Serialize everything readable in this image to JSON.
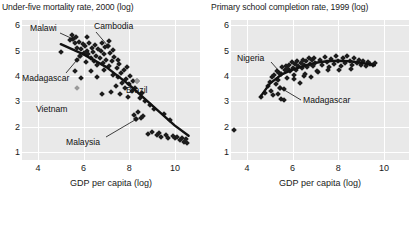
{
  "charts": [
    {
      "id": "under-five-mortality",
      "title": "Under-five mortality rate, 2000 (log)",
      "xlabel": "GDP per capita (log)",
      "ylabel": "",
      "xticks": [
        "4",
        "6",
        "8",
        "10"
      ],
      "yticks": [
        "6",
        "5",
        "4",
        "3",
        "2",
        "1"
      ],
      "annotations": [
        {
          "label": "Malawi",
          "x": 0.16,
          "y": 0.12
        },
        {
          "label": "Cambodia",
          "x": 0.53,
          "y": 0.1
        },
        {
          "label": "Madagascar",
          "x": 0.05,
          "y": 0.43
        },
        {
          "label": "Vietnam",
          "x": 0.22,
          "y": 0.62
        },
        {
          "label": "Brazil",
          "x": 0.74,
          "y": 0.5
        },
        {
          "label": "Malaysia",
          "x": 0.45,
          "y": 0.86
        }
      ]
    },
    {
      "id": "primary-school-completion",
      "title": "Primary school completion rate, 1999 (log)",
      "xlabel": "GDP per capita (log)",
      "ylabel": "",
      "xticks": [
        "4",
        "6",
        "8",
        "10"
      ],
      "yticks": [
        "6",
        "5",
        "4",
        "3",
        "2",
        "1"
      ],
      "annotations": [
        {
          "label": "Nigeria",
          "x": 0.12,
          "y": 0.26
        },
        {
          "label": "Madagascar",
          "x": 0.45,
          "y": 0.58
        }
      ]
    }
  ],
  "chart_data": [
    {
      "type": "scatter",
      "title": "Under-five mortality rate, 2000 (log)",
      "xlabel": "GDP per capita (log)",
      "ylabel": "Under-five mortality rate, 2000 (log)",
      "xlim": [
        3.3,
        11.1
      ],
      "ylim": [
        0.7,
        6.2
      ],
      "xticks": [
        4,
        6,
        8,
        10
      ],
      "yticks": [
        1,
        2,
        3,
        4,
        5,
        6
      ],
      "grid": true,
      "legend": false,
      "trendline": {
        "type": "linear-fit",
        "points": [
          [
            5.0,
            5.25
          ],
          [
            6.0,
            4.85
          ],
          [
            7.0,
            4.35
          ],
          [
            8.0,
            3.65
          ],
          [
            9.0,
            2.85
          ],
          [
            10.0,
            2.05
          ],
          [
            10.6,
            1.65
          ]
        ]
      },
      "highlighted_points": [
        {
          "label": "Malawi",
          "x": 5.55,
          "y": 5.45,
          "style": "dark"
        },
        {
          "label": "Cambodia",
          "x": 7.05,
          "y": 5.2,
          "style": "dark"
        },
        {
          "label": "Madagascar",
          "x": 5.85,
          "y": 4.78,
          "style": "dark"
        },
        {
          "label": "Vietnam",
          "x": 5.7,
          "y": 3.52,
          "style": "light"
        },
        {
          "label": "Brazil",
          "x": 8.35,
          "y": 3.82,
          "style": "light"
        },
        {
          "label": "Malaysia",
          "x": 8.3,
          "y": 2.3,
          "style": "dark"
        }
      ],
      "points": [
        [
          5.0,
          4.95
        ],
        [
          5.4,
          5.4
        ],
        [
          5.5,
          5.62
        ],
        [
          5.55,
          5.45
        ],
        [
          5.6,
          5.3
        ],
        [
          5.65,
          5.55
        ],
        [
          5.7,
          5.12
        ],
        [
          5.72,
          4.62
        ],
        [
          5.8,
          5.35
        ],
        [
          5.85,
          4.78
        ],
        [
          5.9,
          5.05
        ],
        [
          5.95,
          5.25
        ],
        [
          6.0,
          4.9
        ],
        [
          6.05,
          5.18
        ],
        [
          6.1,
          4.55
        ],
        [
          6.15,
          5.0
        ],
        [
          6.2,
          4.85
        ],
        [
          6.25,
          5.28
        ],
        [
          6.3,
          4.72
        ],
        [
          6.35,
          5.1
        ],
        [
          6.4,
          4.95
        ],
        [
          6.45,
          4.6
        ],
        [
          6.5,
          5.22
        ],
        [
          6.55,
          4.8
        ],
        [
          6.6,
          4.45
        ],
        [
          6.65,
          5.08
        ],
        [
          6.7,
          4.7
        ],
        [
          6.75,
          4.98
        ],
        [
          6.8,
          5.3
        ],
        [
          6.85,
          4.52
        ],
        [
          6.9,
          4.88
        ],
        [
          6.95,
          5.15
        ],
        [
          7.0,
          4.65
        ],
        [
          7.05,
          5.2
        ],
        [
          7.1,
          4.4
        ],
        [
          7.15,
          4.92
        ],
        [
          7.2,
          3.38
        ],
        [
          7.25,
          4.58
        ],
        [
          7.3,
          4.05
        ],
        [
          7.35,
          4.75
        ],
        [
          7.4,
          3.62
        ],
        [
          7.45,
          4.3
        ],
        [
          7.5,
          3.95
        ],
        [
          7.55,
          4.48
        ],
        [
          7.6,
          3.28
        ],
        [
          7.65,
          4.12
        ],
        [
          7.7,
          3.72
        ],
        [
          7.75,
          4.22
        ],
        [
          7.8,
          3.52
        ],
        [
          7.85,
          3.88
        ],
        [
          7.9,
          4.35
        ],
        [
          7.95,
          3.18
        ],
        [
          8.0,
          3.68
        ],
        [
          8.05,
          4.02
        ],
        [
          8.1,
          3.42
        ],
        [
          8.15,
          3.82
        ],
        [
          8.2,
          2.48
        ],
        [
          8.25,
          3.55
        ],
        [
          8.3,
          2.3
        ],
        [
          8.35,
          3.82
        ],
        [
          8.4,
          2.58
        ],
        [
          8.45,
          3.12
        ],
        [
          8.5,
          2.35
        ],
        [
          8.55,
          3.32
        ],
        [
          8.6,
          2.42
        ],
        [
          8.7,
          3.02
        ],
        [
          8.8,
          1.72
        ],
        [
          8.9,
          2.88
        ],
        [
          9.0,
          1.8
        ],
        [
          9.1,
          2.72
        ],
        [
          9.2,
          1.68
        ],
        [
          9.3,
          1.78
        ],
        [
          9.4,
          1.62
        ],
        [
          9.5,
          2.52
        ],
        [
          9.6,
          1.7
        ],
        [
          9.7,
          1.58
        ],
        [
          9.8,
          2.28
        ],
        [
          9.9,
          1.65
        ],
        [
          10.0,
          1.55
        ],
        [
          10.1,
          1.62
        ],
        [
          10.2,
          1.48
        ],
        [
          10.3,
          1.58
        ],
        [
          10.4,
          1.42
        ],
        [
          10.5,
          1.52
        ],
        [
          10.55,
          1.38
        ],
        [
          6.3,
          4.18
        ],
        [
          6.6,
          3.95
        ],
        [
          6.9,
          4.22
        ],
        [
          7.1,
          5.38
        ],
        [
          7.3,
          5.02
        ],
        [
          7.5,
          4.62
        ],
        [
          6.15,
          5.52
        ],
        [
          5.6,
          4.2
        ],
        [
          6.8,
          3.3
        ],
        [
          5.9,
          3.92
        ]
      ]
    },
    {
      "type": "scatter",
      "title": "Primary school completion rate, 1999 (log)",
      "xlabel": "GDP per capita (log)",
      "ylabel": "Primary school completion rate, 1999 (log)",
      "xlim": [
        3.3,
        11.1
      ],
      "ylim": [
        0.7,
        6.2
      ],
      "xticks": [
        4,
        6,
        8,
        10
      ],
      "yticks": [
        1,
        2,
        3,
        4,
        5,
        6
      ],
      "grid": true,
      "legend": false,
      "trendline": {
        "type": "loess",
        "points": [
          [
            4.6,
            3.2
          ],
          [
            5.0,
            3.7
          ],
          [
            5.5,
            4.05
          ],
          [
            6.0,
            4.25
          ],
          [
            6.5,
            4.4
          ],
          [
            7.0,
            4.52
          ],
          [
            7.5,
            4.58
          ],
          [
            8.0,
            4.6
          ],
          [
            8.5,
            4.58
          ],
          [
            9.0,
            4.52
          ],
          [
            9.6,
            4.42
          ]
        ]
      },
      "highlighted_points": [
        {
          "label": "Nigeria",
          "x": 5.5,
          "y": 4.1,
          "style": "dark"
        },
        {
          "label": "Madagascar",
          "x": 5.45,
          "y": 3.55,
          "style": "dark"
        }
      ],
      "points": [
        [
          4.6,
          3.18
        ],
        [
          4.8,
          3.35
        ],
        [
          4.9,
          3.6
        ],
        [
          5.0,
          3.78
        ],
        [
          5.05,
          3.42
        ],
        [
          5.1,
          3.95
        ],
        [
          5.15,
          3.25
        ],
        [
          5.2,
          4.05
        ],
        [
          5.25,
          3.68
        ],
        [
          5.3,
          4.2
        ],
        [
          5.35,
          3.85
        ],
        [
          5.4,
          4.12
        ],
        [
          5.45,
          3.55
        ],
        [
          5.48,
          3.1
        ],
        [
          5.5,
          4.1
        ],
        [
          5.55,
          4.35
        ],
        [
          5.6,
          3.05
        ],
        [
          5.65,
          4.22
        ],
        [
          5.7,
          4.4
        ],
        [
          5.75,
          3.92
        ],
        [
          5.8,
          4.28
        ],
        [
          5.85,
          4.45
        ],
        [
          5.9,
          4.18
        ],
        [
          5.95,
          4.55
        ],
        [
          6.0,
          4.32
        ],
        [
          6.05,
          3.88
        ],
        [
          6.1,
          4.48
        ],
        [
          6.15,
          4.25
        ],
        [
          6.2,
          4.6
        ],
        [
          6.25,
          4.38
        ],
        [
          6.3,
          3.72
        ],
        [
          6.35,
          4.52
        ],
        [
          6.4,
          4.3
        ],
        [
          6.45,
          4.65
        ],
        [
          6.5,
          4.42
        ],
        [
          6.55,
          4.08
        ],
        [
          6.6,
          4.58
        ],
        [
          6.65,
          4.35
        ],
        [
          6.7,
          4.7
        ],
        [
          6.75,
          4.48
        ],
        [
          6.8,
          3.98
        ],
        [
          6.85,
          4.62
        ],
        [
          6.9,
          4.4
        ],
        [
          6.95,
          4.72
        ],
        [
          7.0,
          4.52
        ],
        [
          7.1,
          4.15
        ],
        [
          7.2,
          4.65
        ],
        [
          7.3,
          4.45
        ],
        [
          7.4,
          4.75
        ],
        [
          7.5,
          4.55
        ],
        [
          7.6,
          4.35
        ],
        [
          7.7,
          4.68
        ],
        [
          7.8,
          4.48
        ],
        [
          7.9,
          4.78
        ],
        [
          8.0,
          4.58
        ],
        [
          8.1,
          4.38
        ],
        [
          8.2,
          4.7
        ],
        [
          8.3,
          4.5
        ],
        [
          8.4,
          4.8
        ],
        [
          8.5,
          4.6
        ],
        [
          8.6,
          4.42
        ],
        [
          8.7,
          4.72
        ],
        [
          8.8,
          4.52
        ],
        [
          8.9,
          4.65
        ],
        [
          9.0,
          4.45
        ],
        [
          9.1,
          4.58
        ],
        [
          9.2,
          4.38
        ],
        [
          9.3,
          4.55
        ],
        [
          9.4,
          4.48
        ],
        [
          9.5,
          4.42
        ],
        [
          9.6,
          4.5
        ],
        [
          6.05,
          4.05
        ],
        [
          6.5,
          4.02
        ],
        [
          7.05,
          4.2
        ],
        [
          7.55,
          4.25
        ],
        [
          8.05,
          4.22
        ],
        [
          8.55,
          4.28
        ],
        [
          5.35,
          3.3
        ],
        [
          5.6,
          3.48
        ],
        [
          3.45,
          1.88
        ]
      ]
    }
  ]
}
